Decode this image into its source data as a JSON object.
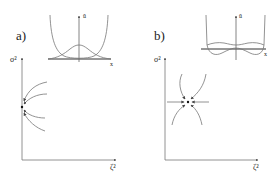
{
  "panels": [
    {
      "id": "a",
      "label": "a)",
      "inset": {
        "y_label": "ū",
        "x_label": "x"
      },
      "main": {
        "y_label": "σ²",
        "x_label": "ζ²"
      },
      "description": "Fixed point on the σ² axis with four flow curves approaching it from the right"
    },
    {
      "id": "b",
      "label": "b)",
      "inset": {
        "y_label": "ū",
        "x_label": "x"
      },
      "main": {
        "y_label": "σ²",
        "x_label": "ζ²"
      },
      "description": "Interior fixed point with flow lines converging from all directions"
    }
  ],
  "colors": {
    "line": "#777777",
    "axis": "#555555",
    "text": "#222222"
  }
}
